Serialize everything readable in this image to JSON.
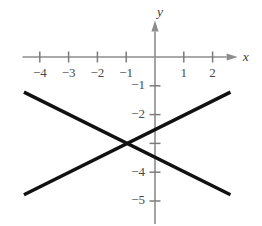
{
  "chart_data": {
    "type": "line",
    "title": "",
    "xlabel": "x",
    "ylabel": "y",
    "grid": false,
    "legend": "none",
    "xlim": [
      -4.6,
      2.8
    ],
    "ylim": [
      -5.8,
      1.2
    ],
    "x_ticks": [
      {
        "value": -4,
        "label": "−4"
      },
      {
        "value": -3,
        "label": "−3"
      },
      {
        "value": -2,
        "label": "−2"
      },
      {
        "value": -1,
        "label": "−1"
      },
      {
        "value": 1,
        "label": "1"
      },
      {
        "value": 2,
        "label": "2"
      }
    ],
    "y_ticks": [
      {
        "value": -1,
        "label": "−1"
      },
      {
        "value": -2,
        "label": "−2"
      },
      {
        "value": -3,
        "label": ""
      },
      {
        "value": -4,
        "label": "−4"
      },
      {
        "value": -5,
        "label": "−5"
      }
    ],
    "series": [
      {
        "name": "ascending-line",
        "points": [
          {
            "x": -4.55,
            "y": -4.78
          },
          {
            "x": 2.62,
            "y": -1.22
          }
        ]
      },
      {
        "name": "descending-line",
        "points": [
          {
            "x": -4.55,
            "y": -1.22
          },
          {
            "x": 2.62,
            "y": -4.78
          }
        ]
      }
    ],
    "intersection": {
      "x": -1.0,
      "y": -3.0
    },
    "line_color": "#111111",
    "axis_color": "#8d8d8d"
  }
}
